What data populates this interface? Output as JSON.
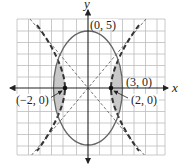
{
  "axes": {
    "x_label": "x",
    "y_label": "y"
  },
  "grid": {
    "xmin": -6,
    "xmax": 6,
    "ymin": -6,
    "ymax": 6
  },
  "ellipse": {
    "a": 3,
    "b": 5,
    "label_top": "(0, 5)",
    "label_right": "(3, 0)"
  },
  "hyperbola": {
    "vertex_left": "(−2, 0)",
    "vertex_right": "(2, 0)"
  },
  "colors": {
    "grid": "#bdbdbd",
    "curve": "#555555",
    "shade": "#c8c8c8",
    "axis": "#222222"
  }
}
